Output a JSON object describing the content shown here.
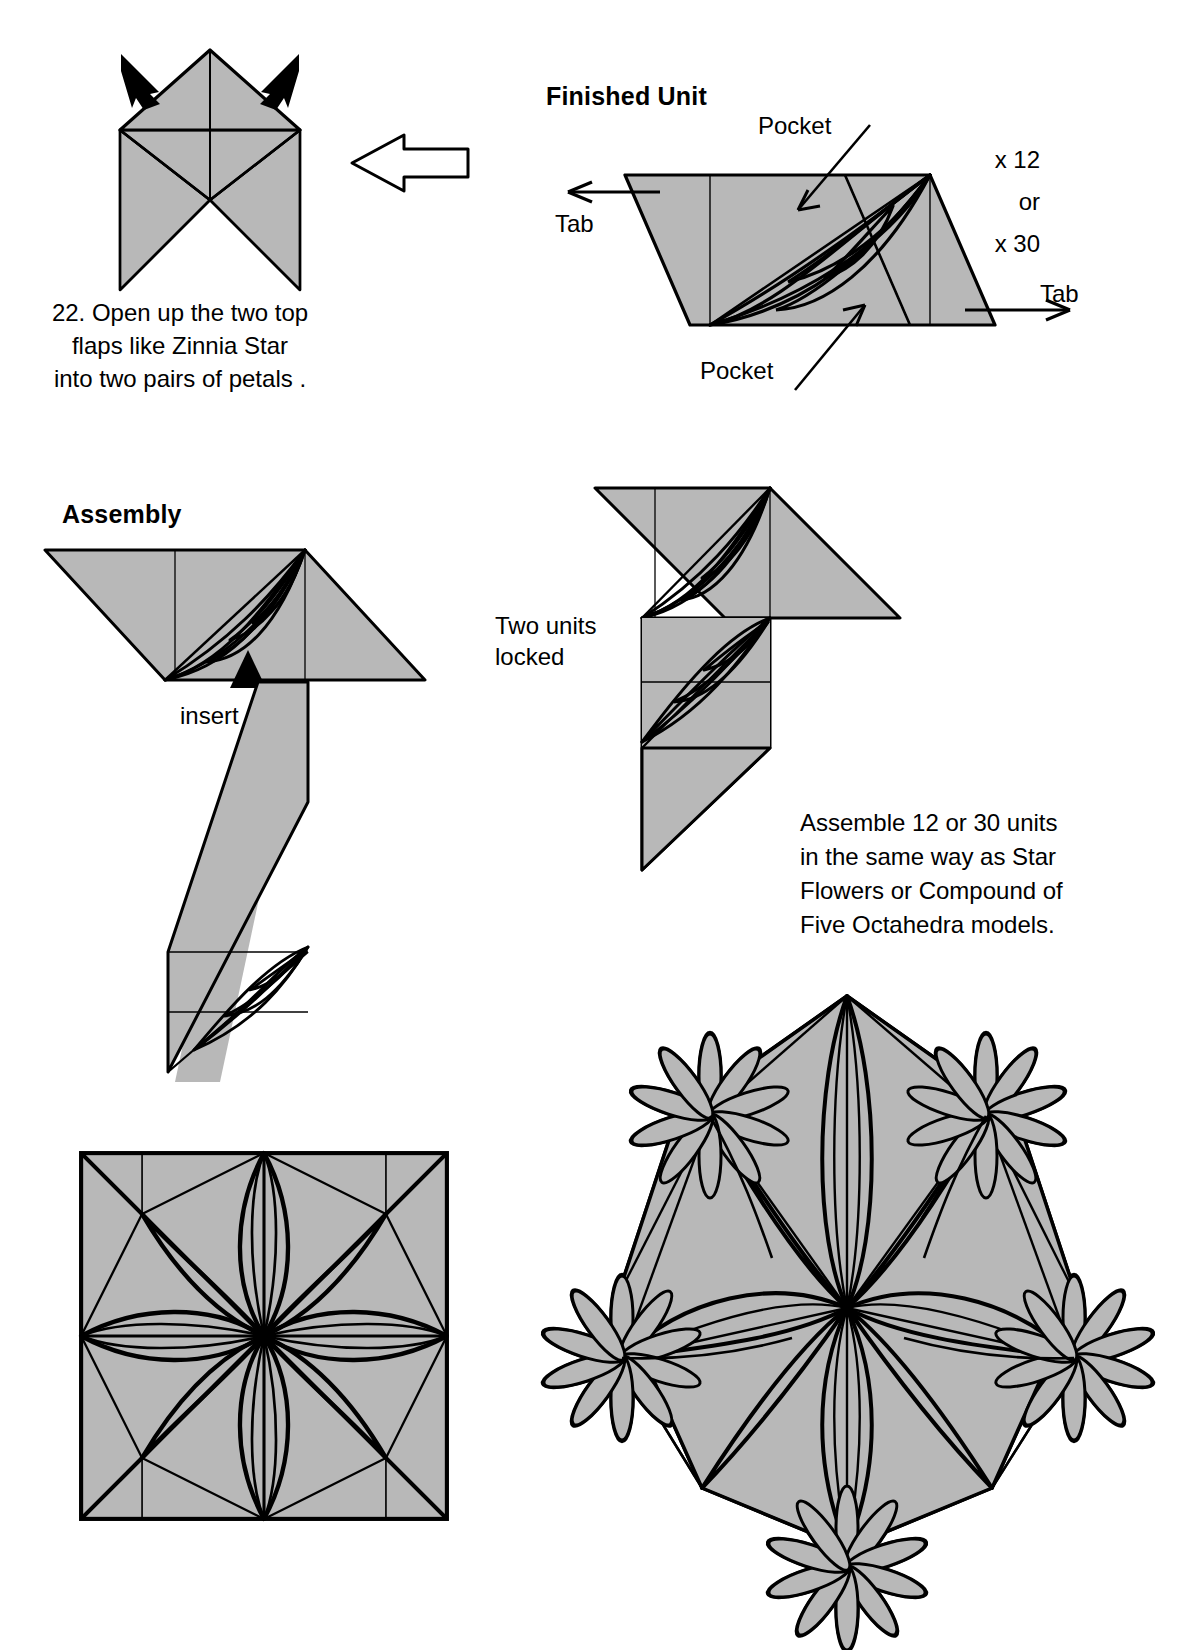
{
  "page": {
    "width": 1198,
    "height": 1650,
    "background": "#ffffff",
    "ink": "#000000",
    "paper_fill": "#b3b3b3",
    "paper_fill_light": "#bdbdbd"
  },
  "step": {
    "number": "22.",
    "caption": "22. Open up the two top\nflaps like Zinnia Star\ninto two pairs of petals ."
  },
  "finished_unit": {
    "heading": "Finished Unit",
    "pocket_top_label": "Pocket",
    "pocket_bottom_label": "Pocket",
    "tab_left_label": "Tab",
    "tab_right_label": "Tab",
    "count_line1": "x 12",
    "count_line2": "or",
    "count_line3": "x 30"
  },
  "assembly": {
    "heading": "Assembly",
    "insert_label": "insert",
    "two_units_locked_label": "Two units\nlocked",
    "note": "Assemble 12 or 30 units\nin the same way as Star\nFlowers or Compound of\nFive Octahedra models."
  },
  "models": {
    "flat_model_name": "square-flower-model",
    "solid_model_name": "dodecahedral-flower-ball-model"
  },
  "icons": {
    "fold_arrow": "hollow-arrow-icon",
    "push_arrow": "solid-arrow-icon",
    "pointer_arrow": "line-arrow-icon"
  }
}
